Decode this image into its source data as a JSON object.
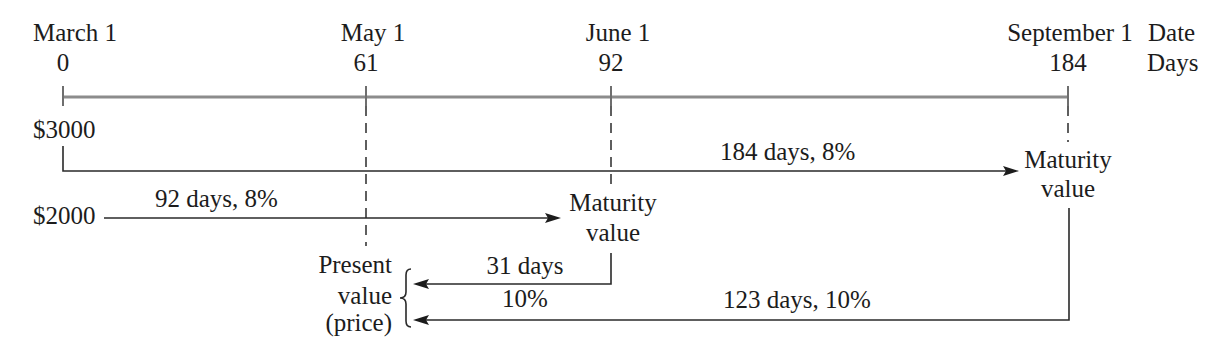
{
  "timeline": {
    "row_labels": {
      "date": "Date",
      "days": "Days"
    },
    "points": [
      {
        "date": "March 1",
        "days": "0"
      },
      {
        "date": "May 1",
        "days": "61"
      },
      {
        "date": "June 1",
        "days": "92"
      },
      {
        "date": "September 1",
        "days": "184"
      }
    ]
  },
  "notes": [
    {
      "principal": "$3000",
      "term_label": "184 days, 8%",
      "maturity_line1": "Maturity",
      "maturity_line2": "value"
    },
    {
      "principal": "$2000",
      "term_label": "92 days, 8%",
      "maturity_line1": "Maturity",
      "maturity_line2": "value"
    }
  ],
  "discounting": {
    "present_value_lines": [
      "Present",
      "value",
      "(price)"
    ],
    "short_note": {
      "days_label": "31 days",
      "rate_label": "10%"
    },
    "long_note": {
      "label": "123 days, 10%"
    }
  },
  "colors": {
    "text": "#1c1c1c",
    "timeline": "#8c8c8c",
    "lines": "#2a2a2a",
    "background": "#ffffff"
  }
}
